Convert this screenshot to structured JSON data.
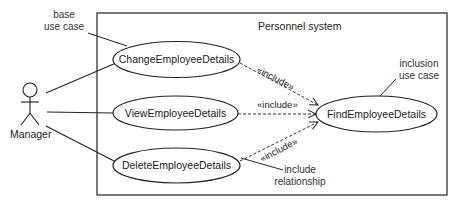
{
  "diagram": {
    "type": "uml-use-case",
    "system_boundary": {
      "title": "Personnel system"
    },
    "actor": {
      "name": "Manager"
    },
    "use_cases": [
      {
        "id": "change",
        "label": "ChangeEmployeeDetails"
      },
      {
        "id": "view",
        "label": "ViewEmployeeDetails"
      },
      {
        "id": "delete",
        "label": "DeleteEmployeeDetails"
      },
      {
        "id": "find",
        "label": "FindEmployeeDetails"
      }
    ],
    "relationships": [
      {
        "from": "Manager",
        "to": "change",
        "type": "association"
      },
      {
        "from": "Manager",
        "to": "view",
        "type": "association"
      },
      {
        "from": "Manager",
        "to": "delete",
        "type": "association"
      },
      {
        "from": "change",
        "to": "find",
        "type": "include",
        "label": "«include»"
      },
      {
        "from": "view",
        "to": "find",
        "type": "include",
        "label": "«include»"
      },
      {
        "from": "delete",
        "to": "find",
        "type": "include",
        "label": "«include»"
      }
    ],
    "annotations": {
      "base_use_case": [
        "base",
        "use case"
      ],
      "inclusion_use_case": [
        "inclusion",
        "use case"
      ],
      "include_relationship": [
        "include",
        "relationship"
      ]
    },
    "colors": {
      "line": "#222222",
      "background": "#ffffff"
    }
  }
}
